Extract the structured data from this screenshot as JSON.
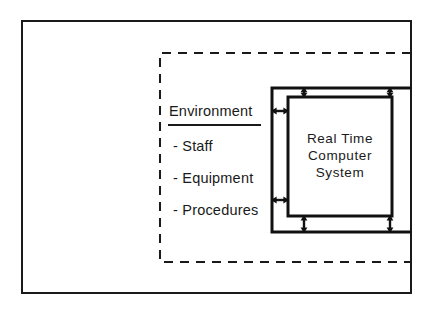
{
  "diagram": {
    "colors": {
      "stroke": "#1a1a1a",
      "thick_stroke": "#111111",
      "background": "#ffffff"
    },
    "outer_boundary": {
      "name": "outer-system-boundary",
      "style": "solid",
      "x": 22,
      "y": 21,
      "width": 389,
      "height": 272
    },
    "dashed_boundary": {
      "name": "environment-boundary",
      "style": "dashed",
      "x": 160,
      "y": 53,
      "width": 251,
      "height": 209
    },
    "band": {
      "name": "interface-band",
      "style": "solid-thick",
      "x": 272,
      "y": 88,
      "width": 139,
      "height": 144
    },
    "inner_box": {
      "name": "real-time-computer-system-box",
      "style": "solid-thick",
      "x": 288,
      "y": 97,
      "width": 104,
      "height": 119
    },
    "environment": {
      "title": "Environment",
      "items": [
        "- Staff",
        "- Equipment",
        "- Procedures"
      ]
    },
    "computer_system": {
      "lines": [
        "Real Time",
        "Computer",
        "System"
      ]
    },
    "arrows": [
      {
        "name": "arrow-top-left",
        "orientation": "vertical",
        "double_headed": true,
        "x": 304,
        "y1": 88,
        "y2": 97
      },
      {
        "name": "arrow-top-right",
        "orientation": "vertical",
        "double_headed": true,
        "x": 390,
        "y1": 88,
        "y2": 97
      },
      {
        "name": "arrow-left-upper",
        "orientation": "horizontal",
        "double_headed": true,
        "y": 111,
        "x1": 272,
        "x2": 288
      },
      {
        "name": "arrow-left-lower",
        "orientation": "horizontal",
        "double_headed": true,
        "y": 200,
        "x1": 272,
        "x2": 288
      },
      {
        "name": "arrow-bottom-left",
        "orientation": "vertical",
        "double_headed": true,
        "x": 304,
        "y1": 216,
        "y2": 232
      },
      {
        "name": "arrow-bottom-right",
        "orientation": "vertical",
        "double_headed": true,
        "x": 390,
        "y1": 216,
        "y2": 232
      }
    ]
  }
}
